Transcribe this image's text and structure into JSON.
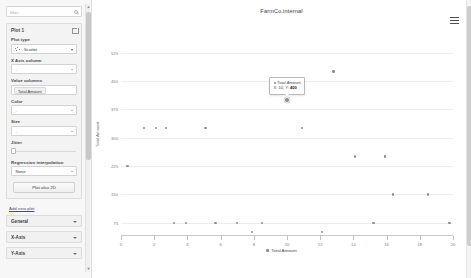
{
  "sidebar": {
    "filter": {
      "placeholder": "filter",
      "value": "",
      "icon": "search-icon"
    },
    "plot_card": {
      "title": "Plot 1",
      "delete_icon": "trash-icon",
      "fields": [
        {
          "label": "Plot type",
          "value": "Scatter",
          "icon": "scatter-icon"
        },
        {
          "label": "X Axis column",
          "value": "-"
        },
        {
          "label": "Value columns",
          "value": "Total Amount"
        },
        {
          "label": "Color",
          "value": "-"
        },
        {
          "label": "Size",
          "value": "-"
        },
        {
          "label": "Jitter",
          "value": ""
        },
        {
          "label": "Regression interpolation",
          "value": "None"
        }
      ],
      "plot_also_button": "Plot also 2D"
    },
    "add_new_plot_link": "Add new plot",
    "accordions": [
      {
        "label": "General"
      },
      {
        "label": "X-Axis"
      },
      {
        "label": "Y-Axis"
      }
    ]
  },
  "header": {
    "title": "FarmCo.internal",
    "menu_icon": "hamburger-menu-icon"
  },
  "tooltip": {
    "series": "Total Amount",
    "xy_text": "X: 10, Y: 400",
    "x_prefix": "X: ",
    "x_value": "10",
    "sep": ", Y: ",
    "y_value": "400"
  },
  "chart_data": {
    "type": "scatter",
    "title": "FarmCo.internal",
    "xlabel": "",
    "ylabel": "Total Amount",
    "legend": [
      "Total Amount"
    ],
    "legend_position": "bottom",
    "grid": true,
    "xlim": [
      0,
      20
    ],
    "ylim": [
      40,
      590
    ],
    "xticks": [
      0,
      2,
      4,
      6,
      8,
      10,
      12,
      14,
      16,
      18,
      20
    ],
    "yticks": [
      75,
      150,
      225,
      300,
      375,
      450,
      525
    ],
    "ytick_labels": [
      "75",
      "150",
      "225",
      "300",
      "375",
      "450",
      "525"
    ],
    "series": [
      {
        "name": "Total Amount",
        "color": "#8e8e8e",
        "points": [
          {
            "x": 0.4,
            "y": 225
          },
          {
            "x": 1.4,
            "y": 325
          },
          {
            "x": 2.1,
            "y": 325
          },
          {
            "x": 2.7,
            "y": 325
          },
          {
            "x": 3.2,
            "y": 75
          },
          {
            "x": 3.9,
            "y": 75
          },
          {
            "x": 5.1,
            "y": 325
          },
          {
            "x": 5.7,
            "y": 75
          },
          {
            "x": 7.0,
            "y": 75
          },
          {
            "x": 7.9,
            "y": 50
          },
          {
            "x": 8.5,
            "y": 75
          },
          {
            "x": 10.0,
            "y": 400
          },
          {
            "x": 10.9,
            "y": 325
          },
          {
            "x": 12.1,
            "y": 50
          },
          {
            "x": 12.8,
            "y": 475
          },
          {
            "x": 14.1,
            "y": 250
          },
          {
            "x": 15.2,
            "y": 75
          },
          {
            "x": 15.9,
            "y": 250
          },
          {
            "x": 16.4,
            "y": 150
          },
          {
            "x": 18.5,
            "y": 150
          },
          {
            "x": 19.8,
            "y": 75
          }
        ]
      }
    ],
    "highlighted_point": {
      "x": 10,
      "y": 400
    }
  }
}
